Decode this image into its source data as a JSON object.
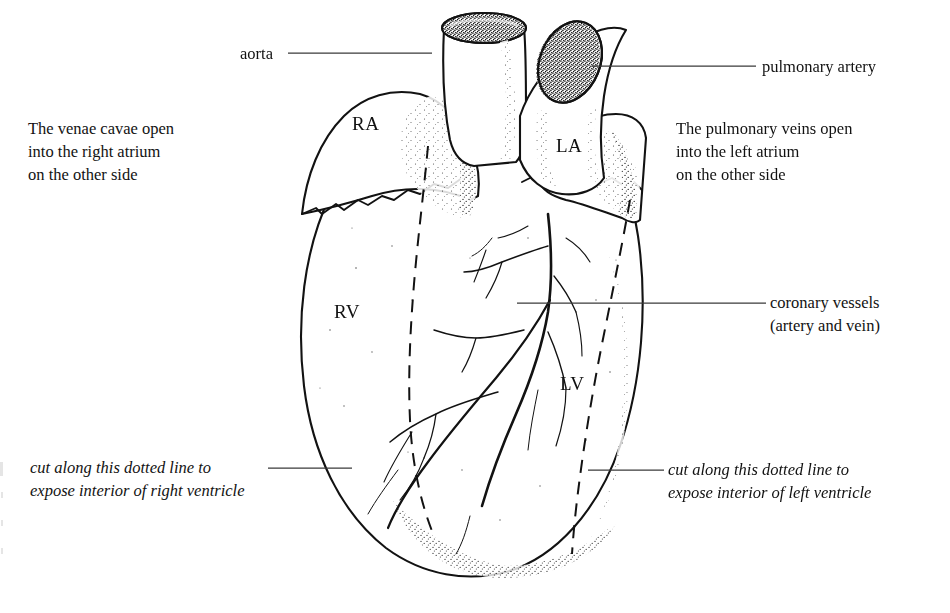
{
  "figure": {
    "kind": "anatomical-line-drawing",
    "style": "pen-and-ink stipple line drawing, black on white"
  },
  "callouts": {
    "aorta": {
      "text": "aorta",
      "side": "left",
      "x": 240,
      "y": 44
    },
    "pulmonary_artery": {
      "text": "pulmonary artery",
      "side": "right",
      "x": 762,
      "y": 57
    },
    "coronary_vessels": {
      "line1": "coronary vessels",
      "line2": "(artery and vein)",
      "side": "right",
      "x": 770,
      "y": 294
    }
  },
  "notes": {
    "left": {
      "line1": "The venae cavae open",
      "line2": "into the right atrium",
      "line3": "on the other side",
      "x": 28,
      "y": 118
    },
    "right": {
      "line1": "The pulmonary veins open",
      "line2": "into the left atrium",
      "line3": "on the other side",
      "x": 676,
      "y": 118
    }
  },
  "cut_captions": {
    "left": {
      "line1": "cut along this dotted line to",
      "line2": "expose interior of right ventricle",
      "x": 30,
      "y": 458
    },
    "right": {
      "line1": "cut along this dotted line to",
      "line2": "expose interior of left ventricle",
      "x": 668,
      "y": 458
    }
  },
  "chambers": [
    {
      "abbr": "RA",
      "name": "right atrium",
      "x": 352,
      "y": 112
    },
    {
      "abbr": "LA",
      "name": "left atrium",
      "x": 556,
      "y": 134
    },
    {
      "abbr": "RV",
      "name": "right ventricle",
      "x": 334,
      "y": 300
    },
    {
      "abbr": "LV",
      "name": "left ventricle",
      "x": 560,
      "y": 372
    }
  ],
  "colors": {
    "ink": "#121212",
    "paper": "#ffffff",
    "leader_line": "#3a3a3a",
    "stipple": "#1a1a1a"
  },
  "leader_lines": [
    {
      "name": "aorta-leader",
      "x1": 288,
      "y1": 53,
      "x2": 432,
      "y2": 53
    },
    {
      "name": "pulmonary-artery-leader",
      "x1": 592,
      "y1": 66,
      "x2": 756,
      "y2": 66
    },
    {
      "name": "coronary-vessels-leader",
      "x1": 517,
      "y1": 303,
      "x2": 766,
      "y2": 303
    },
    {
      "name": "cut-left-leader",
      "x1": 268,
      "y1": 468,
      "x2": 352,
      "y2": 468
    },
    {
      "name": "cut-right-leader",
      "x1": 588,
      "y1": 470,
      "x2": 664,
      "y2": 470
    }
  ]
}
